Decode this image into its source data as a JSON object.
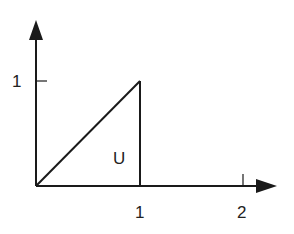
{
  "diagram": {
    "region_label": "U",
    "y_axis": {
      "ticks": [
        {
          "value": 1,
          "label": "1"
        }
      ]
    },
    "x_axis": {
      "ticks": [
        {
          "value": 1,
          "label": "1"
        },
        {
          "value": 2,
          "label": "2"
        }
      ]
    },
    "shape": {
      "type": "triangle",
      "vertices": [
        [
          0,
          0
        ],
        [
          1,
          1
        ],
        [
          1,
          0
        ]
      ]
    },
    "line_color": "#1a1a1a"
  }
}
